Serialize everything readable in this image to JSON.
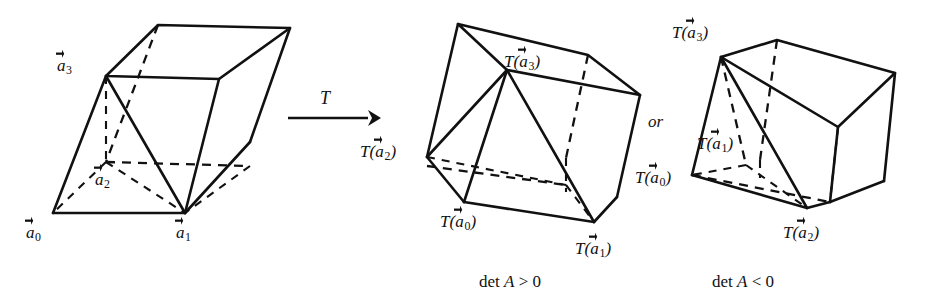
{
  "figure": {
    "background_color": "#ffffff",
    "ink_color": "#111111"
  },
  "transform_arrow": {
    "label": "T",
    "icon": "right-arrow-icon"
  },
  "connector": {
    "or_label": "or"
  },
  "panels": [
    {
      "id": "source",
      "caption": "",
      "vertex_labels": [
        {
          "key": "a0",
          "prefix": "",
          "base": "a",
          "subscript": "0",
          "suffix": "",
          "text": "a⃗0"
        },
        {
          "key": "a1",
          "prefix": "",
          "base": "a",
          "subscript": "1",
          "suffix": "",
          "text": "a⃗1"
        },
        {
          "key": "a2",
          "prefix": "",
          "base": "a",
          "subscript": "2",
          "suffix": "",
          "text": "a⃗2"
        },
        {
          "key": "a3",
          "prefix": "",
          "base": "a",
          "subscript": "3",
          "suffix": "",
          "text": "a⃗3"
        }
      ]
    },
    {
      "id": "det-positive",
      "caption": "det A > 0",
      "caption_parts": {
        "det": "det",
        "matrix": "A",
        "relation": ">",
        "value": "0"
      },
      "vertex_labels": [
        {
          "key": "Ta0",
          "prefix": "T(",
          "base": "a",
          "subscript": "0",
          "suffix": ")",
          "text": "T(a⃗0)"
        },
        {
          "key": "Ta1",
          "prefix": "T(",
          "base": "a",
          "subscript": "1",
          "suffix": ")",
          "text": "T(a⃗1)"
        },
        {
          "key": "Ta2",
          "prefix": "T(",
          "base": "a",
          "subscript": "2",
          "suffix": ")",
          "text": "T(a⃗2)"
        },
        {
          "key": "Ta3",
          "prefix": "T(",
          "base": "a",
          "subscript": "3",
          "suffix": ")",
          "text": "T(a⃗3)"
        }
      ]
    },
    {
      "id": "det-negative",
      "caption": "det A < 0",
      "caption_parts": {
        "det": "det",
        "matrix": "A",
        "relation": "<",
        "value": "0"
      },
      "vertex_labels": [
        {
          "key": "Ta0",
          "prefix": "T(",
          "base": "a",
          "subscript": "0",
          "suffix": ")",
          "text": "T(a⃗0)"
        },
        {
          "key": "Ta1",
          "prefix": "T(",
          "base": "a",
          "subscript": "1",
          "suffix": ")",
          "text": "T(a⃗1)"
        },
        {
          "key": "Ta2",
          "prefix": "T(",
          "base": "a",
          "subscript": "2",
          "suffix": ")",
          "text": "T(a⃗2)"
        },
        {
          "key": "Ta3",
          "prefix": "T(",
          "base": "a",
          "subscript": "3",
          "suffix": ")",
          "text": "T(a⃗3)"
        }
      ]
    }
  ],
  "labels": {
    "src_a0_prefix": "",
    "src_a0_base": "a",
    "src_a0_sub": "0",
    "src_a0_suffix": "",
    "src_a1_base": "a",
    "src_a1_sub": "1",
    "src_a2_base": "a",
    "src_a2_sub": "2",
    "src_a3_base": "a",
    "src_a3_sub": "3",
    "t_open": "T(",
    "t_close": ")",
    "mid_a0_sub": "0",
    "mid_a1_sub": "1",
    "mid_a2_sub": "2",
    "mid_a3_sub": "3",
    "right_a0_sub": "0",
    "right_a1_sub": "1",
    "right_a2_sub": "2",
    "right_a3_sub": "3",
    "a_base": "a",
    "det_text": "det",
    "matrix_name": "A",
    "gt": ">",
    "lt": "<",
    "zero": "0",
    "arrow_label": "T",
    "or_text": "or"
  }
}
